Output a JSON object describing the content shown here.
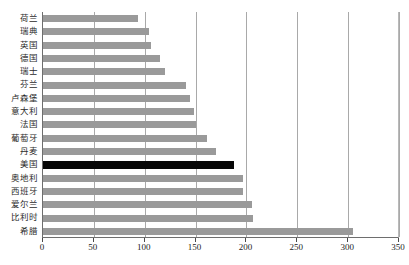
{
  "chart_data": {
    "type": "bar",
    "orientation": "horizontal",
    "title": "",
    "xlabel": "",
    "ylabel": "",
    "xlim": [
      0,
      350
    ],
    "xticks": [
      0,
      50,
      100,
      150,
      200,
      250,
      300,
      350
    ],
    "grid": true,
    "legend": "none",
    "bar_color": "#9a9a9a",
    "highlight_color": "#070707",
    "highlight_category": "美国",
    "categories": [
      "荷兰",
      "瑞典",
      "英国",
      "德国",
      "瑞士",
      "芬兰",
      "卢森堡",
      "意大利",
      "法国",
      "葡萄牙",
      "丹麦",
      "美国",
      "奥地利",
      "西班牙",
      "爱尔兰",
      "比利时",
      "希腊"
    ],
    "values": [
      93,
      104,
      106,
      115,
      120,
      141,
      145,
      148,
      150,
      161,
      170,
      188,
      197,
      197,
      205,
      206,
      305
    ]
  },
  "xaxis": {
    "labels": [
      "0",
      "50",
      "100",
      "150",
      "200",
      "250",
      "300",
      "350"
    ]
  }
}
